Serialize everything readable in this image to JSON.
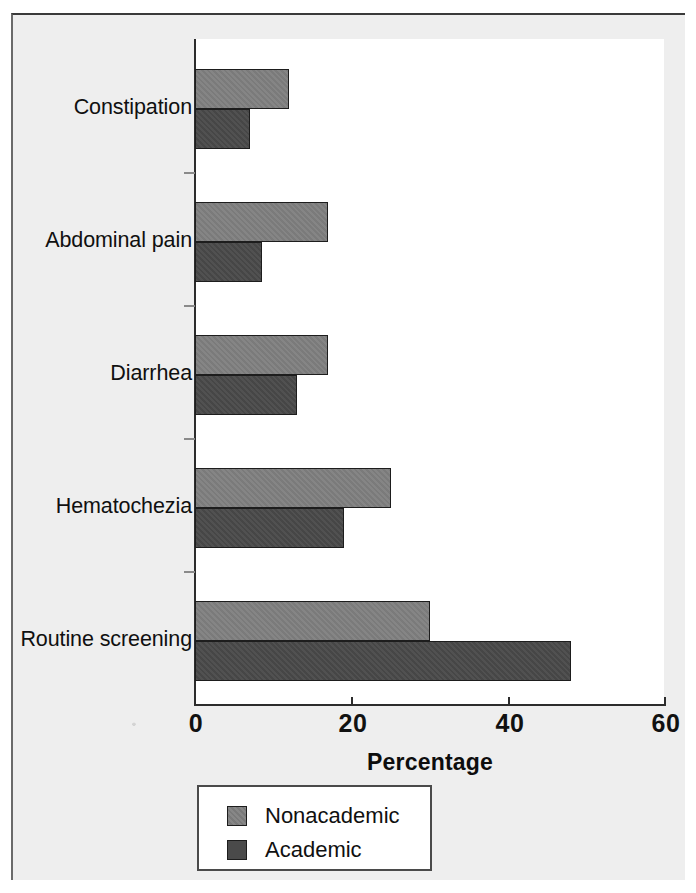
{
  "chart_data": {
    "type": "bar",
    "orientation": "horizontal",
    "title": "",
    "subtitle": "",
    "xlabel": "Percentage",
    "ylabel": "",
    "xlim": [
      0,
      60
    ],
    "xticks": [
      0,
      20,
      40,
      60
    ],
    "xtick_labels": [
      "0",
      "20",
      "40",
      "60"
    ],
    "grid": false,
    "legend_position": "below-axis-left",
    "categories": [
      "Constipation",
      "Abdominal pain",
      "Diarrhea",
      "Hematochezia",
      "Routine screening"
    ],
    "series": [
      {
        "name": "Nonacademic",
        "color": "#808080",
        "values": [
          12,
          17,
          17,
          25,
          30
        ]
      },
      {
        "name": "Academic",
        "color": "#4a4a4a",
        "values": [
          7,
          8.5,
          13,
          19,
          48
        ]
      }
    ]
  },
  "axis": {
    "x_title": "Percentage",
    "tick_labels": [
      "0",
      "20",
      "40",
      "60"
    ]
  },
  "categories": {
    "items": [
      {
        "label": "Constipation"
      },
      {
        "label": "Abdominal pain"
      },
      {
        "label": "Diarrhea"
      },
      {
        "label": "Hematochezia"
      },
      {
        "label": "Routine screening"
      }
    ]
  },
  "legend": {
    "entries": [
      {
        "label": "Nonacademic",
        "color": "#808080"
      },
      {
        "label": "Academic",
        "color": "#4a4a4a"
      }
    ]
  }
}
